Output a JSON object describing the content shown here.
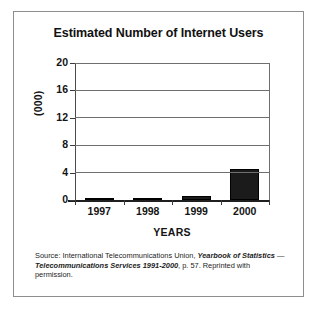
{
  "figure": {
    "title": "Estimated Number of Internet Users",
    "source_prefix": "Source: International Telecommunications Union, ",
    "source_italic_1": "Yearbook of Statistics",
    "source_mid": " — ",
    "source_italic_2": "Telecommunications Services 1991-2000",
    "source_suffix": ", p. 57. Reprinted with permission."
  },
  "chart_data": {
    "type": "bar",
    "title": "Estimated Number of Internet Users",
    "xlabel": "YEARS",
    "ylabel": "(000)",
    "categories": [
      "1997",
      "1998",
      "1999",
      "2000"
    ],
    "values": [
      0.15,
      0.2,
      0.6,
      4.6
    ],
    "ylim": [
      0,
      20
    ],
    "yticks": [
      0,
      4,
      8,
      12,
      16,
      20
    ],
    "ytick_labels": [
      "0",
      "4",
      "8",
      "12",
      "16",
      "20"
    ],
    "grid": true,
    "grid_axis": "y",
    "legend": false,
    "bar_color": "#1b1b1b",
    "series_name": "Internet users"
  }
}
